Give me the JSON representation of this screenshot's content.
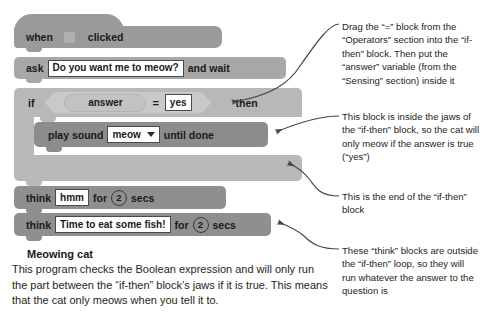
{
  "program": {
    "blocks": [
      {
        "id": "when-flag-clicked",
        "type": "hat",
        "words": [
          "when",
          "clicked"
        ],
        "icon": "green-flag-icon"
      },
      {
        "id": "ask-and-wait",
        "type": "stack",
        "prefix": "ask",
        "input_value": "Do you want me to meow?",
        "suffix": "and wait"
      },
      {
        "id": "if-then",
        "type": "c-block",
        "prefix": "if",
        "suffix": "then",
        "condition": {
          "operator": "=",
          "left_reporter": "answer",
          "right_value": "yes"
        }
      },
      {
        "id": "play-sound-until-done",
        "type": "stack",
        "prefix": "play sound",
        "dropdown_value": "meow",
        "suffix": "until done"
      },
      {
        "id": "think-hmm",
        "type": "stack",
        "prefix": "think",
        "input_value": "hmm",
        "mid": "for",
        "number_value": "2",
        "suffix": "secs"
      },
      {
        "id": "think-fish",
        "type": "stack",
        "prefix": "think",
        "input_value": "Time to eat some fish!",
        "mid": "for",
        "number_value": "2",
        "suffix": "secs"
      }
    ]
  },
  "caption": {
    "title": "Meowing cat",
    "marker": "triangle-icon",
    "body": "This program checks the Boolean expression and will only run the part between the “if-then” block’s jaws if it is true. This means that the cat only meows when you tell it to."
  },
  "annotations": [
    {
      "id": "annotation-equals-block",
      "text": "Drag the “=” block from the “Operators” section into the “if-then” block. Then put the “answer” variable (from the “Sensing” section) inside it"
    },
    {
      "id": "annotation-inside-jaws",
      "text": "This block is inside the jaws of the “if-then” block, so the cat will only meow if the answer is true (“yes”)"
    },
    {
      "id": "annotation-end-of-block",
      "text": "This is the end of the “if-then” block"
    },
    {
      "id": "annotation-think-blocks",
      "text": "These “think” blocks are outside the “if-then” loop, so they will run whatever the answer to the question is"
    }
  ],
  "colors": {
    "page_background": "#ffffff",
    "hat_block": "#9a9a9a",
    "ask_block": "#a8a8a8",
    "if_block": "#b8b8b8",
    "play_sound_block": "#8c8c8c",
    "think_block": "#8f8f8f",
    "boolean_hex": "#c9c9c9",
    "reporter": "#c2c2c2",
    "input_field": "#ffffff",
    "text": "#231f20",
    "leader_line": "#4a4340"
  }
}
